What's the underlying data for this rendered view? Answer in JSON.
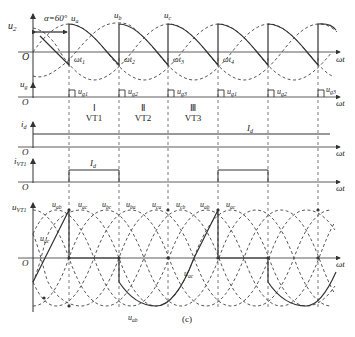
{
  "figure": {
    "caption": "(c)",
    "alpha_label": "α=60°",
    "colors": {
      "line": "#333333",
      "dashed": "#444444",
      "background": "#ffffff"
    }
  },
  "panels": {
    "u2": {
      "ylabel": "u",
      "ylabel_sub": "2",
      "origin": "O",
      "xlabel": "ωt",
      "phase_labels": [
        {
          "main": "u",
          "sub": "a"
        },
        {
          "main": "u",
          "sub": "b"
        },
        {
          "main": "u",
          "sub": "c"
        }
      ],
      "instant_labels": [
        {
          "main": "ωt",
          "sub": "1"
        },
        {
          "main": "ωt",
          "sub": "2"
        },
        {
          "main": "ωt",
          "sub": "3"
        },
        {
          "main": "ωt",
          "sub": "4"
        }
      ]
    },
    "ug": {
      "ylabel": "u",
      "ylabel_sub": "g",
      "origin": "O",
      "xlabel": "ωt",
      "pulses": [
        {
          "main": "u",
          "sub": "g1"
        },
        {
          "main": "u",
          "sub": "g2"
        },
        {
          "main": "u",
          "sub": "g3"
        },
        {
          "main": "u",
          "sub": "g1"
        },
        {
          "main": "u",
          "sub": "g2"
        },
        {
          "main": "u",
          "sub": "g3"
        }
      ],
      "intervals": [
        {
          "roman": "Ⅰ",
          "device": "VT1"
        },
        {
          "roman": "Ⅱ",
          "device": "VT2"
        },
        {
          "roman": "Ⅲ",
          "device": "VT3"
        }
      ]
    },
    "id": {
      "ylabel": "i",
      "ylabel_sub": "d",
      "origin": "O",
      "xlabel": "ωt",
      "level_label": {
        "main": "I",
        "sub": "d"
      }
    },
    "ivt1": {
      "ylabel": "i",
      "ylabel_sub": "VT1",
      "origin": "O",
      "xlabel": "ωt",
      "level_label": {
        "main": "I",
        "sub": "d"
      }
    },
    "uvt1": {
      "ylabel": "u",
      "ylabel_sub": "VT1",
      "origin": "O",
      "xlabel": "ωt",
      "line_voltage_labels": [
        {
          "main": "u",
          "sub": "ab"
        },
        {
          "main": "u",
          "sub": "ac"
        },
        {
          "main": "u",
          "sub": "bc"
        },
        {
          "main": "u",
          "sub": "ba"
        },
        {
          "main": "u",
          "sub": "ca"
        },
        {
          "main": "u",
          "sub": "cb"
        },
        {
          "main": "u",
          "sub": "ab"
        },
        {
          "main": "u",
          "sub": "ac"
        }
      ],
      "inner_labels": [
        {
          "main": "u",
          "sub": "ac"
        },
        {
          "main": "u",
          "sub": "ac"
        },
        {
          "main": "u",
          "sub": "ab"
        }
      ]
    }
  }
}
